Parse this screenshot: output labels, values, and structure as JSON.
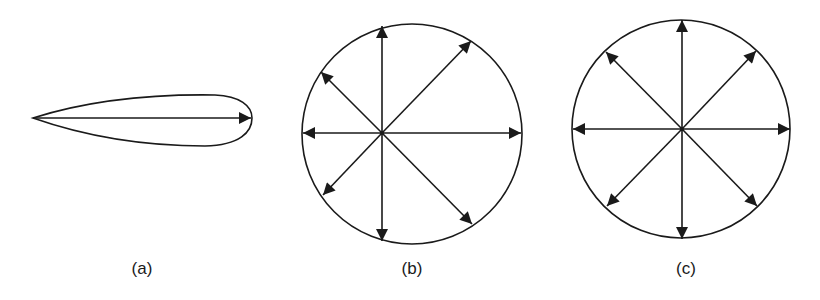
{
  "figure": {
    "panels": [
      {
        "id": "a",
        "label": "(a)",
        "type": "directional-lobe",
        "arrow_directions": 1
      },
      {
        "id": "b",
        "label": "(b)",
        "type": "circle-with-radial-arrows-offset-origin",
        "arrow_directions": 8
      },
      {
        "id": "c",
        "label": "(c)",
        "type": "circle-with-radial-arrows-centered-origin",
        "arrow_directions": 8
      }
    ],
    "colors": {
      "stroke": "#1a1a1a",
      "background": "#ffffff"
    }
  }
}
